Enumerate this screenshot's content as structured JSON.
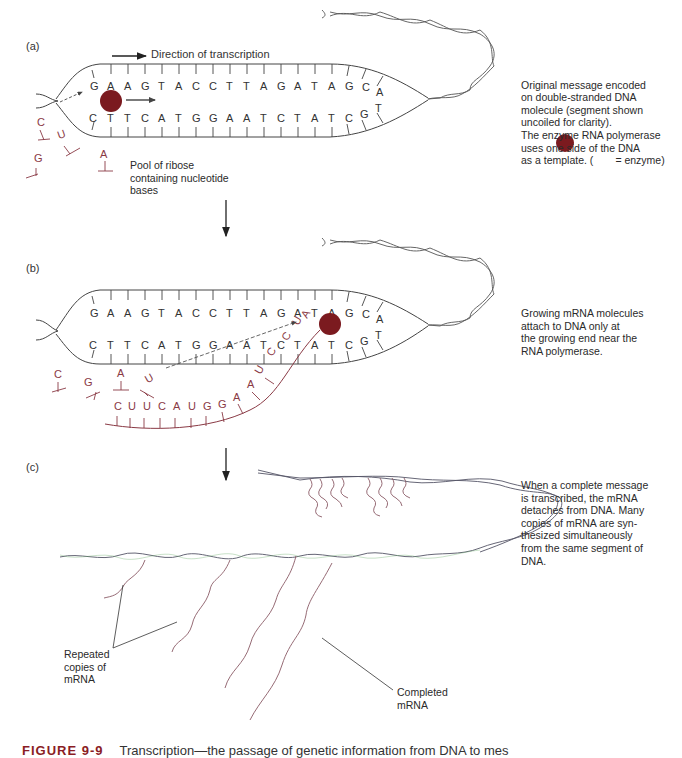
{
  "figure": {
    "number_label": "FIGURE 9-9",
    "caption": "Transcription—the passage of genetic information from DNA to mes",
    "enzyme_color": "#7b1a1f",
    "rna_color": "#8a3a45"
  },
  "panels": {
    "a": {
      "label": "(a)",
      "direction_label": "Direction of transcription",
      "template_strand_top": [
        "G",
        "A",
        "A",
        "G",
        "T",
        "A",
        "C",
        "C",
        "T",
        "T",
        "A",
        "G",
        "A",
        "T",
        "A",
        "G",
        "C",
        "A"
      ],
      "template_strand_bottom": [
        "C",
        "T",
        "T",
        "C",
        "A",
        "T",
        "G",
        "G",
        "A",
        "A",
        "T",
        "C",
        "T",
        "A",
        "T",
        "C",
        "G",
        "T"
      ],
      "free_nucleotides": [
        "C",
        "U",
        "G",
        "A"
      ],
      "pool_label": "Pool of ribose\ncontaining nucleotide\nbases",
      "note": "Original message encoded\non double-stranded DNA\nmolecule (segment shown\nuncoiled for clarity).\nThe enzyme RNA polymerase\nuses one side of the DNA\nas a template.  (",
      "note_suffix": "= enzyme)"
    },
    "b": {
      "label": "(b)",
      "template_strand_top": [
        "G",
        "A",
        "A",
        "G",
        "T",
        "A",
        "C",
        "C",
        "T",
        "T",
        "A",
        "G",
        "A",
        "T",
        "A",
        "G",
        "C",
        "A"
      ],
      "template_strand_bottom": [
        "C",
        "T",
        "T",
        "C",
        "A",
        "T",
        "G",
        "G",
        "A",
        "A",
        "T",
        "C",
        "T",
        "A",
        "T",
        "C",
        "G",
        "T"
      ],
      "free_nucleotides": [
        "C",
        "G",
        "A",
        "U"
      ],
      "growing_mrna": [
        "C",
        "U",
        "U",
        "C",
        "A",
        "U",
        "G",
        "G",
        "A",
        "A",
        "U",
        "C",
        "C",
        "U",
        "A"
      ],
      "note": "Growing mRNA molecules\nattach to DNA only at\nthe growing end near the\nRNA polymerase."
    },
    "c": {
      "label": "(c)",
      "repeated_label": "Repeated\ncopies of\nmRNA",
      "completed_label": "Completed\nmRNA",
      "note": "When a complete message\nis transcribed, the mRNA\ndetaches from DNA. Many\ncopies of mRNA are syn-\nthesized simultaneously\nfrom the same segment of\nDNA."
    }
  }
}
